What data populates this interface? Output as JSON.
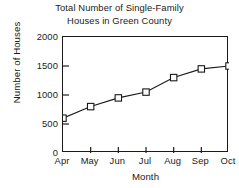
{
  "chart_data": {
    "type": "line",
    "title": "Total Number of Single-Family\nHouses in Green County",
    "title_line1": "Total Number of Single-Family",
    "title_line2": "Houses in Green County",
    "xlabel": "Month",
    "ylabel": "Number of Houses",
    "categories": [
      "Apr",
      "May",
      "Jun",
      "Jul",
      "Aug",
      "Sep",
      "Oct"
    ],
    "values": [
      600,
      800,
      950,
      1050,
      1300,
      1450,
      1500
    ],
    "ylim": [
      0,
      2000
    ],
    "yticks": [
      0,
      500,
      1000,
      1500,
      2000
    ],
    "ytick_labels": [
      "0",
      "500",
      "1000",
      "1500",
      "2000"
    ],
    "grid": false,
    "legend": "none",
    "marker": "open-square",
    "line_color": "#1a1a1a",
    "marker_face_color": "#ffffff",
    "marker_edge_color": "#1a1a1a",
    "axis_color": "#1a1a1a",
    "background_color": "#ffffff"
  }
}
